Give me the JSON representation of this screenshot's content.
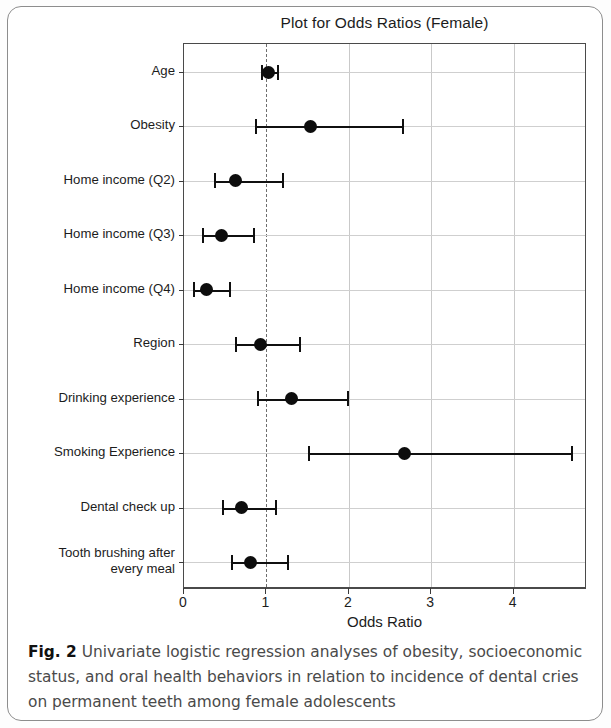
{
  "figure": {
    "caption_label": "Fig. 2",
    "caption_text": " Univariate logistic regression analyses of obesity, socioeconomic status, and oral health behaviors in relation to incidence of dental cries on permanent teeth among female adolescents"
  },
  "chart_data": {
    "type": "scatter",
    "subtype": "forest-plot",
    "title": "Plot for Odds Ratios (Female)",
    "xlabel": "Odds Ratio",
    "ylabel": "",
    "xlim": [
      0,
      4.89
    ],
    "xticks": [
      0,
      1,
      2,
      3,
      4
    ],
    "xtick_labels": [
      "0",
      "1",
      "2",
      "3",
      "4"
    ],
    "grid": true,
    "reference_line": 1,
    "legend": "none",
    "categories": [
      "Age",
      "Obesity",
      "Home income (Q2)",
      "Home income (Q3)",
      "Home income (Q4)",
      "Region",
      "Drinking experience",
      "Smoking Experience",
      "Dental check up",
      "Tooth brushing after\nevery meal"
    ],
    "values": [
      1.02,
      1.53,
      0.63,
      0.45,
      0.27,
      0.93,
      1.3,
      2.67,
      0.7,
      0.81
    ],
    "ci_lower": [
      0.94,
      0.86,
      0.36,
      0.22,
      0.11,
      0.62,
      0.88,
      1.5,
      0.46,
      0.57
    ],
    "ci_upper": [
      1.13,
      2.64,
      1.19,
      0.84,
      0.55,
      1.4,
      1.98,
      4.69,
      1.11,
      1.25
    ],
    "point_color": "#0d0d0d",
    "line_color": "#101010",
    "grid_color": "#cfcfcf"
  }
}
